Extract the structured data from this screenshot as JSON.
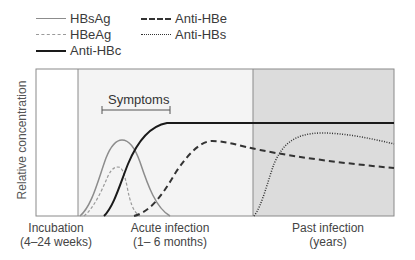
{
  "legend": {
    "items": [
      {
        "label": "HBsAg",
        "style": "solid-gray"
      },
      {
        "label": "HBeAg",
        "style": "dashed-gray"
      },
      {
        "label": "Anti-HBc",
        "style": "solid-black"
      },
      {
        "label": "Anti-HBe",
        "style": "dashed-black"
      },
      {
        "label": "Anti-HBs",
        "style": "dotted-black"
      }
    ]
  },
  "axes": {
    "ylabel": "Relative concentration"
  },
  "annotation": {
    "symptoms": "Symptoms"
  },
  "phases": [
    {
      "name": "Incubation",
      "duration": "(4–24 weeks)"
    },
    {
      "name": "Acute infection",
      "duration": "(1– 6 months)"
    },
    {
      "name": "Past infection",
      "duration": "(years)"
    }
  ],
  "colors": {
    "incubation_bg": "#ffffff",
    "acute_bg": "#f4f4f4",
    "past_bg": "#dcdcdc",
    "frame": "#8a8a8a",
    "gray_series": "#8c8c8c",
    "black_series": "#1a1a1a"
  }
}
